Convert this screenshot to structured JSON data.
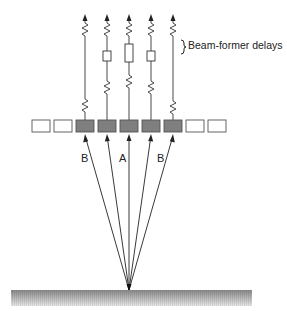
{
  "diagram": {
    "title": "",
    "annotation": "Beam-former delays",
    "ray_labels": [
      "B",
      "A",
      "B"
    ],
    "colors": {
      "active_element": "#7f7f7f",
      "inactive_element": "#ffffff",
      "element_stroke": "#555555",
      "line": "#333333",
      "ground_top": "#8a8a8a",
      "ground_bottom": "#e6e6e6"
    },
    "array": {
      "element_count": 9,
      "active_elements": [
        3,
        4,
        5,
        6,
        7
      ],
      "inactive_elements": [
        1,
        2,
        8,
        9
      ]
    },
    "channels": [
      {
        "id": 1,
        "delay_box": false
      },
      {
        "id": 2,
        "delay_box": true
      },
      {
        "id": 3,
        "delay_box": true,
        "delay_size": "large"
      },
      {
        "id": 4,
        "delay_box": true
      },
      {
        "id": 5,
        "delay_box": false
      }
    ],
    "focal_point": "reflector on ground surface",
    "ground_label": ""
  }
}
